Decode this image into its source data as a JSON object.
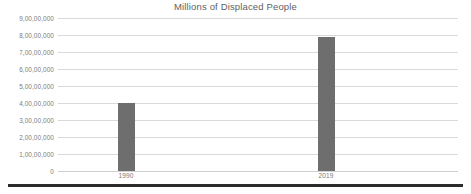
{
  "chart_data": {
    "type": "bar",
    "title": "Millions of Displaced People",
    "xlabel": "",
    "ylabel": "",
    "categories": [
      "1990",
      "2019"
    ],
    "values": [
      40000000,
      79000000
    ],
    "value_labels": [
      "4,00,00,000",
      "7,90,00,000"
    ],
    "ylim": [
      0,
      90000000
    ],
    "ytick_values": [
      0,
      10000000,
      20000000,
      30000000,
      40000000,
      50000000,
      60000000,
      70000000,
      80000000,
      90000000
    ],
    "ytick_labels": [
      "0",
      "1,00,00,000",
      "2,00,00,000",
      "3,00,00,000",
      "4,00,00,000",
      "5,00,00,000",
      "6,00,00,000",
      "7,00,00,000",
      "8,00,00,000",
      "9,00,00,000"
    ],
    "grid": true,
    "grid_axis": "y",
    "legend": false,
    "legend_position": "none",
    "series": [
      {
        "name": "Displaced People",
        "values": [
          40000000,
          79000000
        ]
      }
    ]
  },
  "colors": {
    "bar": "#6e6e6e",
    "gridline": "#d9d9d9",
    "title_text": "#5f5f5f",
    "tick_text": "#7b7b7b",
    "background": "#ffffff",
    "page_rule": "#2b2b2b"
  },
  "figure": {
    "title": "Millions of Displaced People"
  }
}
